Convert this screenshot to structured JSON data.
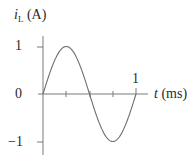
{
  "chart_data": {
    "type": "line",
    "title": "",
    "xlabel_var": "t",
    "xlabel_unit": " (ms)",
    "ylabel_var": "i",
    "ylabel_sub": "L",
    "ylabel_unit": " (A)",
    "x_tick_labels": [
      "1"
    ],
    "y_tick_labels": [
      "1",
      "0",
      "−1"
    ],
    "xlim": [
      0,
      1.25
    ],
    "ylim": [
      -1.2,
      1.2
    ],
    "grid": false,
    "legend": null,
    "series": [
      {
        "name": "i_L(t) = sin(2π t / 1 ms)",
        "x": [
          0,
          0.125,
          0.25,
          0.375,
          0.5,
          0.625,
          0.75,
          0.875,
          1.0
        ],
        "values": [
          0,
          0.707,
          1,
          0.707,
          0,
          -0.707,
          -1,
          -0.707,
          0
        ]
      }
    ],
    "annotations": [
      "minor ticks at t = 0.25, 0.5, 0.75 ms"
    ]
  },
  "colors": {
    "curve": "#6e6e6e",
    "axis": "#7a7a7a",
    "text": "#2a2a2a"
  }
}
